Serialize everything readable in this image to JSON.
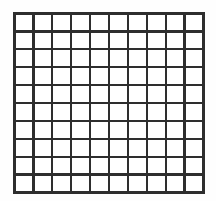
{
  "figure": {
    "name": "square-grid",
    "type": "grid",
    "rows": 10,
    "columns": 10,
    "cell_count": 100,
    "line_color": "#2e2e2e",
    "cell_color": "#ffffff",
    "background_color": "#fefefe",
    "line_thickness_px": 2.6,
    "bounds": {
      "left_px": 13,
      "top_px": 12,
      "width_px": 192,
      "height_px": 182
    },
    "labels": [],
    "annotations": [],
    "cells": [
      [
        "",
        "",
        "",
        "",
        "",
        "",
        "",
        "",
        "",
        ""
      ],
      [
        "",
        "",
        "",
        "",
        "",
        "",
        "",
        "",
        "",
        ""
      ],
      [
        "",
        "",
        "",
        "",
        "",
        "",
        "",
        "",
        "",
        ""
      ],
      [
        "",
        "",
        "",
        "",
        "",
        "",
        "",
        "",
        "",
        ""
      ],
      [
        "",
        "",
        "",
        "",
        "",
        "",
        "",
        "",
        "",
        ""
      ],
      [
        "",
        "",
        "",
        "",
        "",
        "",
        "",
        "",
        "",
        ""
      ],
      [
        "",
        "",
        "",
        "",
        "",
        "",
        "",
        "",
        "",
        ""
      ],
      [
        "",
        "",
        "",
        "",
        "",
        "",
        "",
        "",
        "",
        ""
      ],
      [
        "",
        "",
        "",
        "",
        "",
        "",
        "",
        "",
        "",
        ""
      ],
      [
        "",
        "",
        "",
        "",
        "",
        "",
        "",
        "",
        "",
        ""
      ]
    ]
  }
}
